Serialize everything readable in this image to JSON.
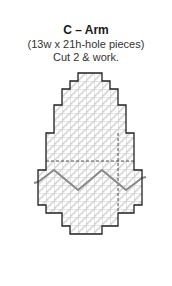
{
  "diagram": {
    "title": "C – Arm",
    "dimensions": "(13w x 21h-hole pieces)",
    "instruction": "Cut 2 & work.",
    "piece": {
      "name": "Arm",
      "label": "C",
      "width_holes": 13,
      "height_holes": 21,
      "cut_count": 2
    },
    "colors": {
      "outline": "#222222",
      "grid": "#c8c8c8",
      "stitch": "#d4d4d4",
      "zigzag": "#8a8a8a",
      "dashed": "#555555"
    }
  }
}
